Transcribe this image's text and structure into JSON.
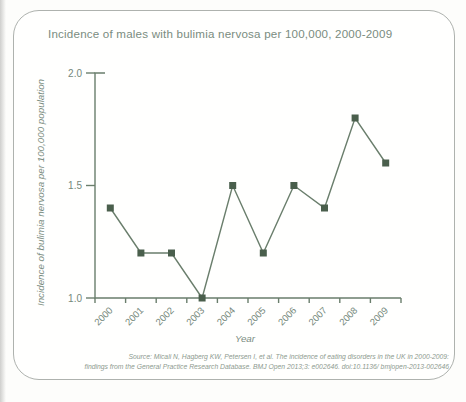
{
  "chart_data": {
    "type": "line",
    "title": "Incidence of males with bulimia nervosa per 100,000, 2000-2009",
    "x": [
      "2000",
      "2001",
      "2002",
      "2003",
      "2004",
      "2005",
      "2006",
      "2007",
      "2008",
      "2009"
    ],
    "values": [
      1.4,
      1.2,
      1.2,
      1.0,
      1.5,
      1.2,
      1.5,
      1.4,
      1.8,
      1.6
    ],
    "xlabel": "Year",
    "ylabel": "Incidence of bulimia nervosa per 100,000 population",
    "ylim": [
      1.0,
      2.0
    ],
    "yticks": [
      1.0,
      1.5,
      2.0
    ],
    "ytick_labels": [
      "1.0",
      "1.5",
      "2.0"
    ],
    "marker": "square",
    "grid": false,
    "legend_position": "none"
  },
  "source": {
    "line1": "Source: Micali N, Hagberg KW, Petersen I, et al. The incidence of eating disorders in the UK in 2000-2009:",
    "line2": "findings from the General Practice Research Database. BMJ Open 2013;3: e002646. doi:10.1136/ bmjopen-2013-002646"
  },
  "colors": {
    "marker": "#4a5f4c",
    "line": "#6a7e6c",
    "axis": "#6a7e6c",
    "tick_text": "#75887b",
    "title_text": "#7a8c80",
    "source_text": "#8d9a8f",
    "border": "#aeb2ae"
  }
}
